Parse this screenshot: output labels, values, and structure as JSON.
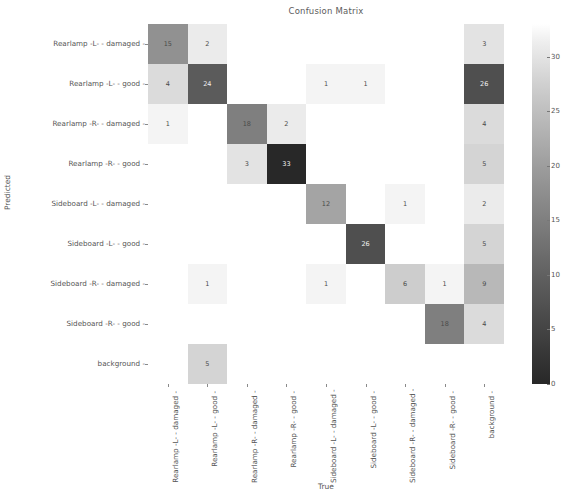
{
  "chart_data": {
    "type": "heatmap",
    "title": "Confusion Matrix",
    "xlabel": "True",
    "ylabel": "Predicted",
    "categories_x": [
      "Rearlamp -L- - damaged",
      "Rearlamp -L- - good",
      "Rearlamp -R- - damaged",
      "Rearlamp -R- - good",
      "Sideboard -L- - damaged",
      "Sideboard -L- - good",
      "Sideboard -R- - damaged",
      "Sideboard -R- - good",
      "background"
    ],
    "categories_y": [
      "Rearlamp -L- - damaged",
      "Rearlamp -L- - good",
      "Rearlamp -R- - damaged",
      "Rearlamp -R- - good",
      "Sideboard -L- - damaged",
      "Sideboard -L- - good",
      "Sideboard -R- - damaged",
      "Sideboard -R- - good",
      "background"
    ],
    "matrix": [
      [
        15,
        2,
        0,
        0,
        0,
        0,
        0,
        0,
        3
      ],
      [
        4,
        24,
        0,
        0,
        1,
        1,
        0,
        0,
        26
      ],
      [
        1,
        0,
        18,
        2,
        0,
        0,
        0,
        0,
        4
      ],
      [
        0,
        0,
        3,
        33,
        0,
        0,
        0,
        0,
        5
      ],
      [
        0,
        0,
        0,
        0,
        12,
        0,
        1,
        0,
        2
      ],
      [
        0,
        0,
        0,
        0,
        0,
        26,
        0,
        0,
        5
      ],
      [
        0,
        1,
        0,
        0,
        1,
        0,
        6,
        1,
        9
      ],
      [
        0,
        0,
        0,
        0,
        0,
        0,
        0,
        18,
        4
      ],
      [
        0,
        5,
        0,
        0,
        0,
        0,
        0,
        0,
        0
      ]
    ],
    "colorbar": {
      "ticks": [
        "0",
        "5",
        "10",
        "15",
        "20",
        "25",
        "30"
      ],
      "vmin": 0,
      "vmax": 33,
      "colormap": "greys"
    },
    "grid": false,
    "legend_position": "right-colorbar"
  }
}
